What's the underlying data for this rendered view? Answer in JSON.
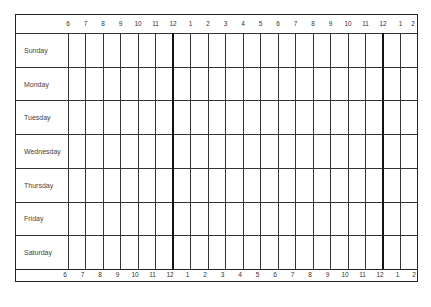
{
  "schedule": {
    "hours_top": [
      "6",
      "7",
      "8",
      "9",
      "10",
      "11",
      "12",
      "1",
      "2",
      "3",
      "4",
      "5",
      "6",
      "7",
      "8",
      "9",
      "10",
      "11",
      "12",
      "1",
      "2"
    ],
    "hours_bottom": [
      "6",
      "7",
      "8",
      "9",
      "10",
      "11",
      "12",
      "1",
      "2",
      "3",
      "4",
      "5",
      "6",
      "7",
      "8",
      "9",
      "10",
      "11",
      "12",
      "1",
      "2"
    ],
    "days": [
      "Sunday",
      "Monday",
      "Tuesday",
      "Wednesday",
      "Thursday",
      "Friday",
      "Saturday"
    ],
    "thick_line_hour_indices": [
      6,
      18
    ]
  }
}
